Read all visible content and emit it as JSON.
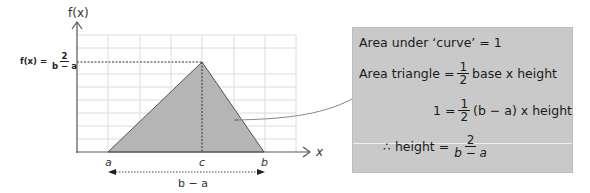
{
  "diagram": {
    "y_axis_label": "f(x)",
    "x_axis_label": "x",
    "peak_label": {
      "prefix": "f(x) =",
      "numerator": "2",
      "denominator": "b − a"
    },
    "x_ticks": {
      "a": "a",
      "c": "c",
      "b": "b"
    },
    "base_label": "b − a",
    "colors": {
      "triangle_fill": "#b5b5b5",
      "grid": "#d9d9d9",
      "axis": "#555555",
      "box_fill": "#c9c9c9"
    }
  },
  "explanation_box": {
    "line1": "Area under ‘curve’ = 1",
    "line2": {
      "prefix": "Area triangle =",
      "frac_num": "1",
      "frac_den": "2",
      "suffix": "base x height"
    },
    "line3": {
      "prefix": "1 =",
      "frac_num": "1",
      "frac_den": "2",
      "suffix": "(b − a) x height"
    },
    "line4": {
      "prefix": "∴ height =",
      "frac_num": "2",
      "frac_den": "b − a"
    }
  }
}
